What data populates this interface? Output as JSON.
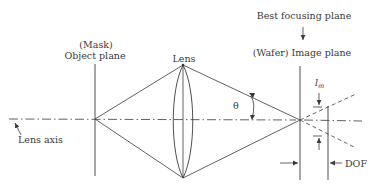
{
  "diagram": {
    "labels": {
      "mask": "(Mask)",
      "object_plane": "Object plane",
      "lens": "Lens",
      "best_focus": "Best focusing plane",
      "image_plane": "(Wafer) Image plane",
      "lm_main": "l",
      "lm_sub": "m",
      "theta": "θ",
      "lens_axis": "Lens axis",
      "dof": "DOF"
    },
    "colors": {
      "line": "#3a3a3a",
      "text": "#3a3a3a",
      "background": "#ffffff"
    },
    "elements": [
      "object-plane",
      "lens",
      "image-plane",
      "best-focusing-plane",
      "lens-axis",
      "converging-rays",
      "diverging-rays",
      "angle-theta",
      "lm-dimension",
      "dof-dimension"
    ]
  }
}
